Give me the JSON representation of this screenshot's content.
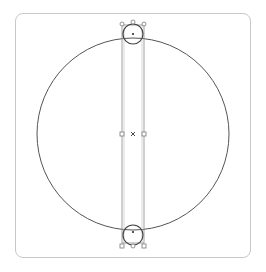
{
  "canvas": {
    "width": 266,
    "height": 272,
    "frame": {
      "x": 15,
      "y": 13,
      "width": 236,
      "height": 245,
      "radius": 8,
      "stroke": "#c8c8c8"
    },
    "main_circle": {
      "cx": 133,
      "cy": 134,
      "r": 96,
      "stroke": "#555555"
    },
    "selection_rect": {
      "x": 122,
      "y": 25,
      "width": 22,
      "height": 218,
      "stroke": "#8a8a8a"
    },
    "center_marker": {
      "x": 133,
      "y": 134,
      "glyph": "×"
    },
    "mid_handles": [
      {
        "x": 122,
        "y": 134
      },
      {
        "x": 144,
        "y": 134
      }
    ],
    "top_knob": {
      "cx": 133,
      "cy": 34,
      "r": 10,
      "handles": [
        {
          "x": 122,
          "y": 24
        },
        {
          "x": 133,
          "y": 22
        },
        {
          "x": 144,
          "y": 24
        }
      ]
    },
    "bottom_knob": {
      "cx": 133,
      "cy": 235,
      "r": 10,
      "handles": [
        {
          "x": 122,
          "y": 246
        },
        {
          "x": 133,
          "y": 247
        },
        {
          "x": 144,
          "y": 246
        }
      ]
    }
  },
  "icons": {
    "center": "center-cross-icon",
    "handle": "selection-handle-icon"
  }
}
